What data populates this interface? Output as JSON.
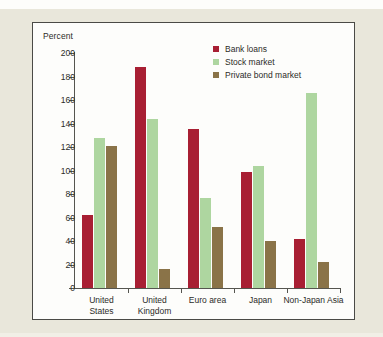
{
  "figure": {
    "panel_background": "#fdfdfb",
    "page_background": "#e9e7db",
    "border_color": "#4a4a46"
  },
  "chart_data": {
    "type": "bar",
    "title": "",
    "subtitle": "",
    "xlabel": "",
    "ylabel": "Percent",
    "ylim": [
      0,
      200
    ],
    "yticks": [
      0,
      20,
      40,
      60,
      80,
      100,
      120,
      140,
      160,
      180,
      200
    ],
    "grid": false,
    "legend_position": "top-right",
    "categories": [
      "United\nStates",
      "United\nKingdom",
      "Euro area",
      "Japan",
      "Non-Japan Asia"
    ],
    "series": [
      {
        "name": "Bank loans",
        "color": "#a81f33",
        "values": [
          62,
          188,
          135,
          99,
          42
        ]
      },
      {
        "name": "Stock market",
        "color": "#aed6a0",
        "values": [
          128,
          144,
          77,
          104,
          166
        ]
      },
      {
        "name": "Private bond market",
        "color": "#8a7348",
        "values": [
          121,
          16,
          52,
          40,
          22
        ]
      }
    ]
  }
}
